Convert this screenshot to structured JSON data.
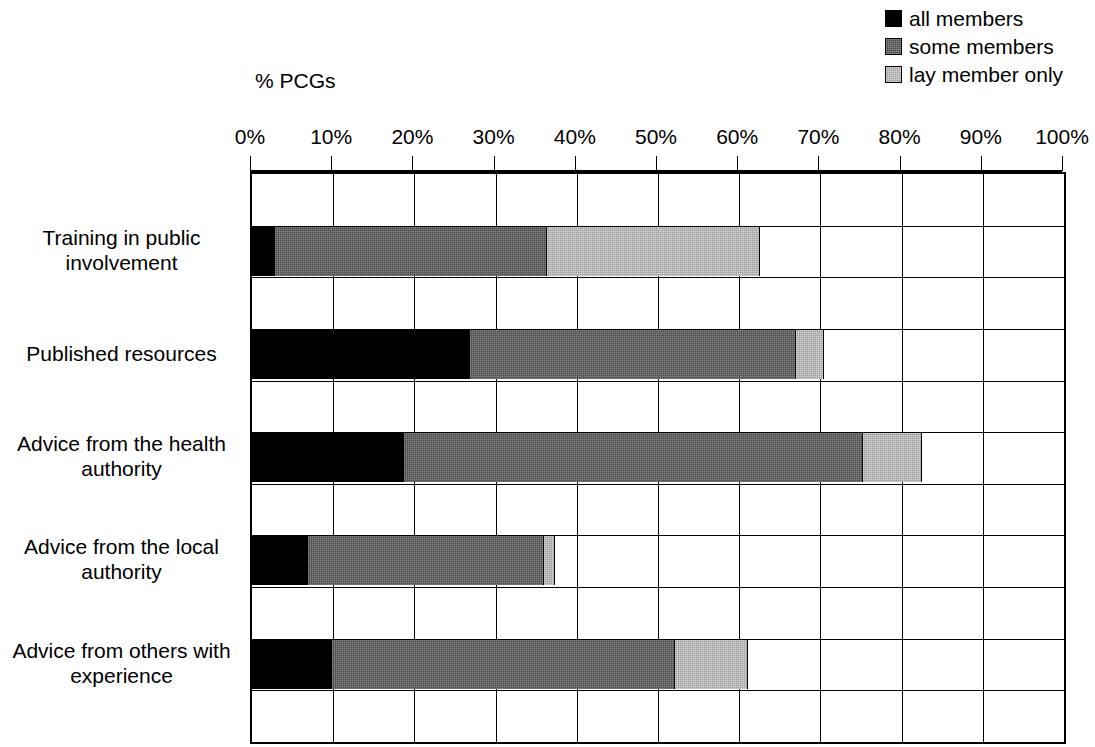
{
  "chart_data": {
    "type": "bar",
    "orientation": "horizontal",
    "stacked": true,
    "title": "",
    "xlabel": "% PCGs",
    "ylabel": "",
    "xlim": [
      0,
      100
    ],
    "xticks": [
      "0%",
      "10%",
      "20%",
      "30%",
      "40%",
      "50%",
      "60%",
      "70%",
      "80%",
      "90%",
      "100%"
    ],
    "xtick_values": [
      0,
      10,
      20,
      30,
      40,
      50,
      60,
      70,
      80,
      90,
      100
    ],
    "grid": "vertical-and-horizontal",
    "legend_position": "top-right",
    "categories": [
      "Training in public involvement",
      "Published resources",
      "Advice from the health authority",
      "Advice from the local authority",
      "Advice from others with experience"
    ],
    "series": [
      {
        "name": "all members",
        "color": "#000000",
        "values": [
          2.8,
          26.8,
          18.7,
          6.9,
          9.8
        ]
      },
      {
        "name": "some members",
        "color": "#4a4a4a",
        "values": [
          33.5,
          40.2,
          56.5,
          29.1,
          42.3
        ]
      },
      {
        "name": "lay member only",
        "color": "#9e9e9e",
        "values": [
          26.3,
          3.4,
          7.3,
          1.3,
          9.0
        ]
      }
    ],
    "cumulative": [
      {
        "category": "Training in public involvement",
        "all": 2.8,
        "all_plus_some": 36.3,
        "total": 62.6
      },
      {
        "category": "Published resources",
        "all": 26.8,
        "all_plus_some": 67.0,
        "total": 70.4
      },
      {
        "category": "Advice from the health authority",
        "all": 18.7,
        "all_plus_some": 75.2,
        "total": 82.5
      },
      {
        "category": "Advice from the local authority",
        "all": 6.9,
        "all_plus_some": 36.0,
        "total": 37.3
      },
      {
        "category": "Advice from others with experience",
        "all": 9.8,
        "all_plus_some": 52.1,
        "total": 61.1
      }
    ]
  },
  "legend": {
    "items": [
      {
        "label": "all members",
        "swatch": "sw-all"
      },
      {
        "label": "some members",
        "swatch": "sw-some"
      },
      {
        "label": "lay member only",
        "swatch": "sw-lay"
      }
    ]
  },
  "axis": {
    "title": "% PCGs"
  },
  "labels": {
    "cat0": "Training in public involvement",
    "cat1": "Published resources",
    "cat2": "Advice from the health authority",
    "cat3": "Advice from the local authority",
    "cat4": "Advice from others with experience"
  }
}
